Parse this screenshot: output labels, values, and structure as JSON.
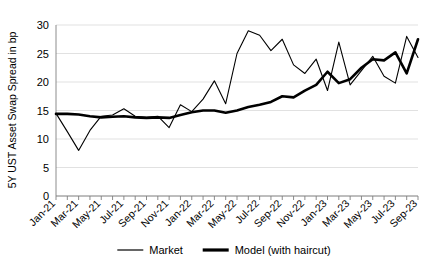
{
  "chart_data": {
    "type": "line",
    "title": "",
    "xlabel": "",
    "ylabel": "5Y UST Asset Swap Spread in bp",
    "ylim": [
      0,
      30
    ],
    "yticks": [
      0,
      5,
      10,
      15,
      20,
      25,
      30
    ],
    "grid": true,
    "legend_position": "bottom",
    "x": [
      "Jan-21",
      "Feb-21",
      "Mar-21",
      "Apr-21",
      "May-21",
      "Jun-21",
      "Jul-21",
      "Aug-21",
      "Sep-21",
      "Oct-21",
      "Nov-21",
      "Dec-21",
      "Jan-22",
      "Feb-22",
      "Mar-22",
      "Apr-22",
      "May-22",
      "Jun-22",
      "Jul-22",
      "Aug-22",
      "Sep-22",
      "Oct-22",
      "Nov-22",
      "Dec-22",
      "Jan-23",
      "Feb-23",
      "Mar-23",
      "Apr-23",
      "May-23",
      "Jun-23",
      "Jul-23",
      "Aug-23",
      "Sep-23"
    ],
    "xtick_labels": [
      "Jan-21",
      "Mar-21",
      "May-21",
      "Jul-21",
      "Sep-21",
      "Nov-21",
      "Jan-22",
      "Mar-22",
      "May-22",
      "Jul-22",
      "Sep-22",
      "Nov-22",
      "Jan-23",
      "Mar-23",
      "May-23",
      "Jul-23",
      "Sep-23"
    ],
    "series": [
      {
        "name": "Market",
        "style": "thin",
        "color": "#000000",
        "width": 1.1,
        "values": [
          14.5,
          11.3,
          8.0,
          11.5,
          14.0,
          14.2,
          15.3,
          14.0,
          13.8,
          14.0,
          12.0,
          16.0,
          14.8,
          17.0,
          20.2,
          16.2,
          25.0,
          29.0,
          28.2,
          25.5,
          27.5,
          23.0,
          21.5,
          24.0,
          18.5,
          27.0,
          19.5,
          22.0,
          24.5,
          21.0,
          19.8,
          28.0,
          24.3
        ]
      },
      {
        "name": "Model (with haircut)",
        "style": "thick",
        "color": "#000000",
        "width": 2.6,
        "values": [
          14.4,
          14.4,
          14.3,
          14.0,
          13.8,
          13.9,
          14.0,
          13.8,
          13.7,
          13.8,
          13.7,
          14.2,
          14.7,
          15.0,
          15.0,
          14.6,
          15.0,
          15.6,
          16.0,
          16.5,
          17.5,
          17.3,
          18.5,
          19.5,
          21.8,
          19.8,
          20.5,
          22.5,
          24.0,
          23.8,
          25.2,
          21.5,
          27.5
        ]
      }
    ],
    "legend": [
      {
        "label": "Market",
        "style": "thin"
      },
      {
        "label": "Model (with haircut)",
        "style": "thick"
      }
    ]
  }
}
